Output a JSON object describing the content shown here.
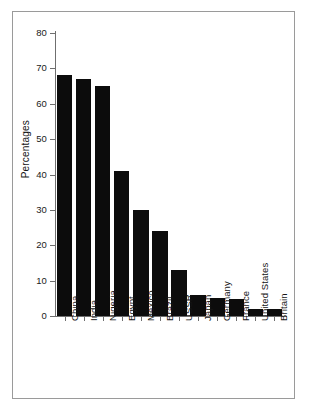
{
  "chart_data": {
    "type": "bar",
    "title": "",
    "xlabel": "",
    "ylabel": "Percentages",
    "ylim": [
      0,
      80
    ],
    "yticks": [
      0,
      10,
      20,
      30,
      40,
      50,
      60,
      70,
      80
    ],
    "grid": false,
    "legend": "none",
    "bar_color": "#0c0c0c",
    "categories": [
      "China",
      "India",
      "Nigeria",
      "Egypt",
      "Mexico",
      "Brazil",
      "USSR",
      "Japan",
      "Germany",
      "France",
      "United States",
      "Britain"
    ],
    "values": [
      68,
      67,
      65,
      41,
      30,
      24,
      13,
      6,
      5,
      4.7,
      2,
      2
    ]
  },
  "figure": {
    "border_color": "#9a9a9a",
    "background": "#ffffff",
    "axis_color": "#6f6f6f"
  }
}
